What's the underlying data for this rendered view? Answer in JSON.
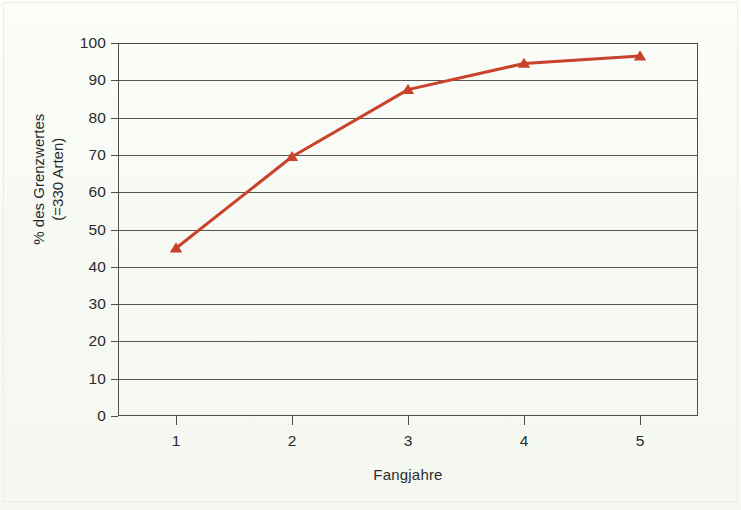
{
  "figure": {
    "background_color": "#f7faf4",
    "line_color": "#c8432a",
    "axis_color": "#4c4f4c",
    "grid_color": "#535653"
  },
  "chart_data": {
    "type": "line",
    "title": "",
    "subtitle": "",
    "xlabel": "Fangjahre",
    "ylabel": "% des Grenzwertes (=330 Arten)",
    "ylabel_line1": "% des Grenzwertes",
    "ylabel_line2": "(=330 Arten)",
    "categories": [
      "1",
      "2",
      "3",
      "4",
      "5"
    ],
    "x": [
      1,
      2,
      3,
      4,
      5
    ],
    "values": [
      45,
      69.5,
      87.5,
      94.5,
      96.5
    ],
    "series": [
      {
        "name": "% des Grenzwertes",
        "values": [
          45,
          69.5,
          87.5,
          94.5,
          96.5
        ],
        "color": "#c8432a",
        "marker": "triangle-up",
        "line_width": 3
      }
    ],
    "ylim": [
      0,
      100
    ],
    "yticks": [
      0,
      10,
      20,
      30,
      40,
      50,
      60,
      70,
      80,
      90,
      100
    ],
    "ytick_labels": [
      "0",
      "10",
      "20",
      "30",
      "40",
      "50",
      "60",
      "70",
      "80",
      "90",
      "100"
    ],
    "xtick_labels": [
      "1",
      "2",
      "3",
      "4",
      "5"
    ],
    "grid": "horizontal",
    "legend": "none",
    "legend_position": "none"
  }
}
